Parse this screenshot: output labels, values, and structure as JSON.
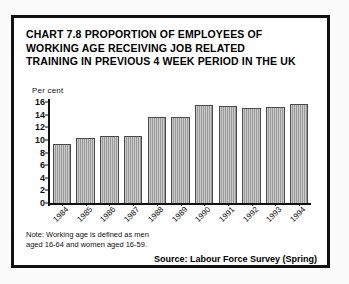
{
  "chart_data": {
    "type": "bar",
    "title": "CHART 7.8 PROPORTION OF EMPLOYEES OF WORKING AGE RECEIVING JOB RELATED TRAINING IN PREVIOUS 4 WEEK PERIOD IN THE UK",
    "title_lines": [
      "CHART 7.8 PROPORTION OF EMPLOYEES OF",
      "WORKING AGE RECEIVING JOB RELATED",
      "TRAINING IN PREVIOUS 4 WEEK PERIOD IN THE UK"
    ],
    "xlabel": "",
    "ylabel": "Per cent",
    "categories": [
      "1984",
      "1985",
      "1986",
      "1987",
      "1988",
      "1989",
      "1990",
      "1991",
      "1992",
      "1993",
      "1994"
    ],
    "values": [
      9.3,
      10.3,
      10.6,
      10.6,
      13.7,
      13.7,
      15.6,
      15.3,
      15.1,
      15.2,
      15.7
    ],
    "ylim": [
      0,
      16
    ],
    "yticks": [
      0,
      2,
      4,
      6,
      8,
      10,
      12,
      14,
      16
    ],
    "ytick_labels": [
      "0",
      "2",
      "4",
      "6",
      "8",
      "10",
      "12",
      "14",
      "16"
    ],
    "grid": false,
    "legend": false,
    "bar_color": "#a9a9a9",
    "bar_edge_color": "#4a4a4a",
    "xtick_rotation": -45
  },
  "note": {
    "lines": [
      "Note: Working age is defined as men",
      "aged 16-64 and women aged 16-59."
    ]
  },
  "source": {
    "text": "Source: Labour Force Survey (Spring)"
  },
  "colors": {
    "frame": "#111111",
    "text": "#111111",
    "background": "#ffffff"
  }
}
